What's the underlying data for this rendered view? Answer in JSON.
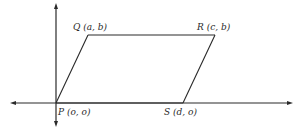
{
  "diagram": {
    "type": "parallelogram-on-coordinate-axes",
    "vertices": [
      {
        "id": "P",
        "label": "P (o, o)",
        "coords": [
          "o",
          "o"
        ]
      },
      {
        "id": "Q",
        "label": "Q (a, b)",
        "coords": [
          "a",
          "b"
        ]
      },
      {
        "id": "R",
        "label": "R (c, b)",
        "coords": [
          "c",
          "b"
        ]
      },
      {
        "id": "S",
        "label": "S (d, o)",
        "coords": [
          "d",
          "o"
        ]
      }
    ],
    "edges": [
      [
        "P",
        "Q"
      ],
      [
        "Q",
        "R"
      ],
      [
        "R",
        "S"
      ],
      [
        "S",
        "P"
      ]
    ],
    "colors": {
      "ink": "#2a2a2a",
      "background": "#ffffff"
    }
  }
}
